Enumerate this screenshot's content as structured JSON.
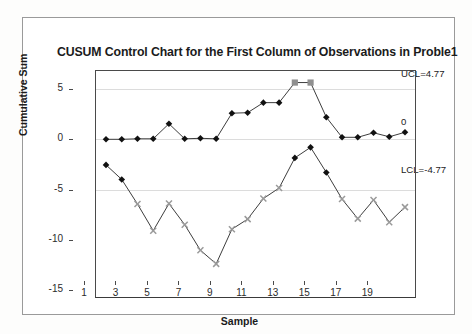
{
  "chart_data": {
    "type": "line",
    "title": "CUSUM Control Chart for the First Column of Observations in Proble1",
    "xlabel": "Sample",
    "ylabel": "Cumulative Sum",
    "xlim": [
      0.3,
      20.7
    ],
    "ylim": [
      -15.8,
      6.9
    ],
    "yticks": [
      5,
      0,
      -5,
      -10,
      -15
    ],
    "ytick_labels": [
      "5",
      "0",
      "-5",
      "-10",
      "-15"
    ],
    "xticks": [
      1,
      3,
      5,
      7,
      9,
      11,
      13,
      15,
      17,
      19
    ],
    "xtick_labels": [
      "1",
      "3",
      "5",
      "7",
      "9",
      "11",
      "13",
      "15",
      "17",
      "19"
    ],
    "gridlines": [
      5,
      0,
      -5
    ],
    "grid": true,
    "legend": "none",
    "x": [
      1,
      2,
      3,
      4,
      5,
      6,
      7,
      8,
      9,
      10,
      11,
      12,
      13,
      14,
      15,
      16,
      17,
      18,
      19,
      20
    ],
    "series": [
      {
        "name": "Upper CUSUM",
        "marker": "diamond",
        "color": "#111111",
        "violation_color": "#8f8f8f",
        "violation_marker": "square",
        "values": [
          0.0,
          0.0,
          0.05,
          0.05,
          1.55,
          0.05,
          0.1,
          0.05,
          2.6,
          2.65,
          3.65,
          3.65,
          5.65,
          5.65,
          2.2,
          0.2,
          0.2,
          0.65,
          0.25,
          0.7
        ],
        "violations": [
          13,
          14
        ]
      },
      {
        "name": "Lower CUSUM",
        "marker": "diamond",
        "color": "#111111",
        "violation_color": "#9a9a9a",
        "violation_marker": "x",
        "values": [
          -2.55,
          -4.0,
          -6.45,
          -9.1,
          -6.4,
          -8.5,
          -11.05,
          -12.4,
          -8.95,
          -7.95,
          -5.9,
          -4.85,
          -1.85,
          -0.8,
          -3.3,
          -5.95,
          -7.9,
          -6.05,
          -8.25,
          -6.75
        ],
        "violations": [
          3,
          4,
          5,
          6,
          7,
          8,
          9,
          10,
          11,
          12,
          16,
          17,
          18,
          19,
          20
        ]
      }
    ],
    "control_limits": [
      {
        "name": "UCL",
        "label": "UCL=4.77",
        "value": 4.77
      },
      {
        "name": "CL",
        "label": "0",
        "value": 0
      },
      {
        "name": "LCL",
        "label": "LCL=-4.77",
        "value": -4.77
      }
    ]
  }
}
